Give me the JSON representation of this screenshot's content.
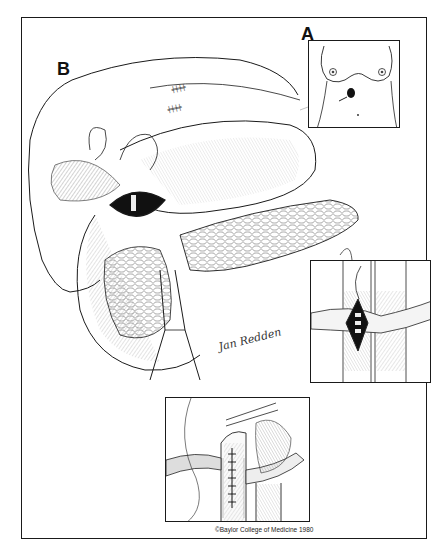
{
  "figure": {
    "panels": [
      {
        "id": "A",
        "label": "A",
        "description": "Torso view showing incision site"
      },
      {
        "id": "B",
        "label": "B",
        "description": "Main operative view of liver, stomach, duodenum and pancreas with opened duct"
      },
      {
        "id": "C",
        "label": "C",
        "description": "Opened vessel with exposed stones"
      },
      {
        "id": "D",
        "label": "D",
        "description": "Sutured vessel closure"
      }
    ],
    "signature": "Jan Redden",
    "copyright": "©Baylor College of Medicine 1980"
  },
  "colors": {
    "ink": "#1a1a1a",
    "background": "#ffffff"
  }
}
